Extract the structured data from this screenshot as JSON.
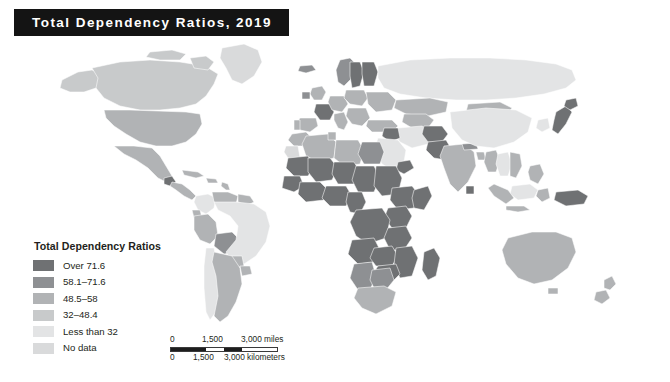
{
  "title": {
    "text": "Total Dependency Ratios, 2019"
  },
  "legend": {
    "title": "Total Dependency Ratios",
    "items": [
      {
        "label": "Over 71.6",
        "color": "#6f7173",
        "class": "c5"
      },
      {
        "label": "58.1–71.6",
        "color": "#8e9093",
        "class": "c4"
      },
      {
        "label": "48.5–58",
        "color": "#b1b3b5",
        "class": "c3"
      },
      {
        "label": "32–48.4",
        "color": "#c8cacb",
        "class": "c2"
      },
      {
        "label": "Less than 32",
        "color": "#e3e4e5",
        "class": "c1"
      },
      {
        "label": "No data",
        "color": "#d9dadb",
        "class": "c0"
      }
    ]
  },
  "scalebar": {
    "miles": {
      "ticks": [
        "0",
        "1,500",
        "3,000 miles"
      ]
    },
    "kilometers": {
      "ticks": [
        "0",
        "1,500",
        "3,000 kilometers"
      ]
    }
  },
  "map": {
    "background": "#ffffff",
    "border_color": "#ffffff",
    "projection": "world-robinson",
    "regions": [
      {
        "name": "Canada",
        "bin": "32–48.4"
      },
      {
        "name": "United States",
        "bin": "48.5–58"
      },
      {
        "name": "Greenland",
        "bin": "No data"
      },
      {
        "name": "Mexico",
        "bin": "48.5–58"
      },
      {
        "name": "Guatemala",
        "bin": "Over 71.6"
      },
      {
        "name": "Central America",
        "bin": "48.5–58"
      },
      {
        "name": "Caribbean",
        "bin": "48.5–58"
      },
      {
        "name": "Colombia",
        "bin": "Less than 32"
      },
      {
        "name": "Venezuela",
        "bin": "48.5–58"
      },
      {
        "name": "Guyanas",
        "bin": "48.5–58"
      },
      {
        "name": "Ecuador",
        "bin": "48.5–58"
      },
      {
        "name": "Peru",
        "bin": "48.5–58"
      },
      {
        "name": "Bolivia",
        "bin": "58.1–71.6"
      },
      {
        "name": "Brazil",
        "bin": "Less than 32"
      },
      {
        "name": "Paraguay",
        "bin": "48.5–58"
      },
      {
        "name": "Chile",
        "bin": "Less than 32"
      },
      {
        "name": "Argentina",
        "bin": "48.5–58"
      },
      {
        "name": "Uruguay",
        "bin": "48.5–58"
      },
      {
        "name": "Morocco",
        "bin": "48.5–58"
      },
      {
        "name": "Algeria",
        "bin": "48.5–58"
      },
      {
        "name": "Libya",
        "bin": "48.5–58"
      },
      {
        "name": "Egypt",
        "bin": "58.1–71.6"
      },
      {
        "name": "Tunisia",
        "bin": "48.5–58"
      },
      {
        "name": "Western Sahara",
        "bin": "No data"
      },
      {
        "name": "Mauritania",
        "bin": "Over 71.6"
      },
      {
        "name": "Mali",
        "bin": "Over 71.6"
      },
      {
        "name": "Niger",
        "bin": "Over 71.6"
      },
      {
        "name": "Chad",
        "bin": "Over 71.6"
      },
      {
        "name": "Sudan",
        "bin": "Over 71.6"
      },
      {
        "name": "Senegal",
        "bin": "Over 71.6"
      },
      {
        "name": "Guinea",
        "bin": "Over 71.6"
      },
      {
        "name": "Nigeria",
        "bin": "Over 71.6"
      },
      {
        "name": "Cameroon",
        "bin": "Over 71.6"
      },
      {
        "name": "Ethiopia",
        "bin": "Over 71.6"
      },
      {
        "name": "Somalia",
        "bin": "Over 71.6"
      },
      {
        "name": "Kenya",
        "bin": "Over 71.6"
      },
      {
        "name": "DR Congo",
        "bin": "Over 71.6"
      },
      {
        "name": "Angola",
        "bin": "Over 71.6"
      },
      {
        "name": "Tanzania",
        "bin": "Over 71.6"
      },
      {
        "name": "Zambia",
        "bin": "Over 71.6"
      },
      {
        "name": "Mozambique",
        "bin": "Over 71.6"
      },
      {
        "name": "Zimbabwe",
        "bin": "Over 71.6"
      },
      {
        "name": "Namibia",
        "bin": "58.1–71.6"
      },
      {
        "name": "Botswana",
        "bin": "58.1–71.6"
      },
      {
        "name": "South Africa",
        "bin": "48.5–58"
      },
      {
        "name": "Madagascar",
        "bin": "Over 71.6"
      },
      {
        "name": "Norway",
        "bin": "58.1–71.6"
      },
      {
        "name": "Sweden",
        "bin": "Over 71.6"
      },
      {
        "name": "Finland",
        "bin": "Over 71.6"
      },
      {
        "name": "United Kingdom",
        "bin": "48.5–58"
      },
      {
        "name": "Ireland",
        "bin": "58.1–71.6"
      },
      {
        "name": "France",
        "bin": "Over 71.6"
      },
      {
        "name": "Spain",
        "bin": "48.5–58"
      },
      {
        "name": "Portugal",
        "bin": "48.5–58"
      },
      {
        "name": "Germany",
        "bin": "48.5–58"
      },
      {
        "name": "Poland",
        "bin": "48.5–58"
      },
      {
        "name": "Italy",
        "bin": "48.5–58"
      },
      {
        "name": "Balkans",
        "bin": "48.5–58"
      },
      {
        "name": "Ukraine",
        "bin": "48.5–58"
      },
      {
        "name": "Turkey",
        "bin": "48.5–58"
      },
      {
        "name": "Russia",
        "bin": "Less than 32"
      },
      {
        "name": "Kazakhstan",
        "bin": "48.5–58"
      },
      {
        "name": "Central Asia",
        "bin": "48.5–58"
      },
      {
        "name": "Iran",
        "bin": "Less than 32"
      },
      {
        "name": "Iraq",
        "bin": "Over 71.6"
      },
      {
        "name": "Saudi Arabia",
        "bin": "Less than 32"
      },
      {
        "name": "Yemen",
        "bin": "Over 71.6"
      },
      {
        "name": "Afghanistan",
        "bin": "Over 71.6"
      },
      {
        "name": "Pakistan",
        "bin": "Over 71.6"
      },
      {
        "name": "India",
        "bin": "48.5–58"
      },
      {
        "name": "Nepal",
        "bin": "58.1–71.6"
      },
      {
        "name": "Bangladesh",
        "bin": "48.5–58"
      },
      {
        "name": "Myanmar",
        "bin": "48.5–58"
      },
      {
        "name": "Thailand",
        "bin": "Less than 32"
      },
      {
        "name": "Vietnam",
        "bin": "48.5–58"
      },
      {
        "name": "China",
        "bin": "Less than 32"
      },
      {
        "name": "Mongolia",
        "bin": "48.5–58"
      },
      {
        "name": "Japan",
        "bin": "Over 71.6"
      },
      {
        "name": "South Korea",
        "bin": "Less than 32"
      },
      {
        "name": "Philippines",
        "bin": "48.5–58"
      },
      {
        "name": "Indonesia",
        "bin": "48.5–58"
      },
      {
        "name": "Malaysia",
        "bin": "Less than 32"
      },
      {
        "name": "Papua New Guinea",
        "bin": "Over 71.6"
      },
      {
        "name": "Australia",
        "bin": "48.5–58"
      },
      {
        "name": "New Zealand",
        "bin": "48.5–58"
      }
    ]
  }
}
